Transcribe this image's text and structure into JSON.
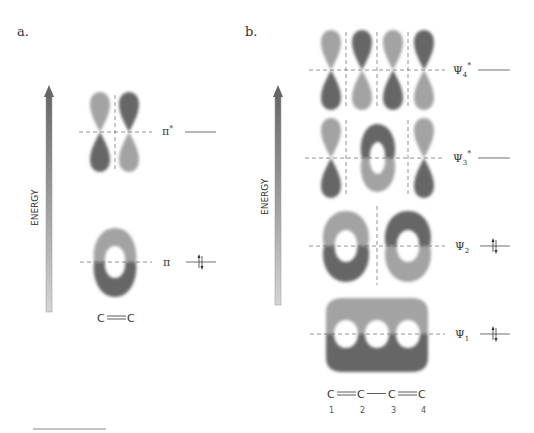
{
  "panels": {
    "a": {
      "label": "a.",
      "axis_label": "ENERGY",
      "molecule": "C═C",
      "molecule_atoms": [
        "C",
        "C"
      ],
      "orbitals": [
        {
          "name": "π*",
          "symbol": "π",
          "superscript": "*",
          "occupancy": 0,
          "type": "antibonding"
        },
        {
          "name": "π",
          "symbol": "π",
          "superscript": "",
          "occupancy": 2,
          "type": "bonding"
        }
      ]
    },
    "b": {
      "label": "b.",
      "axis_label": "ENERGY",
      "molecule": "C═C—C═C",
      "molecule_atoms": [
        "C",
        "C",
        "C",
        "C"
      ],
      "atom_numbers": [
        "1",
        "2",
        "3",
        "4"
      ],
      "orbitals": [
        {
          "name": "Ψ4*",
          "symbol": "Ψ",
          "subscript": "4",
          "superscript": "*",
          "occupancy": 0,
          "nodes": 3
        },
        {
          "name": "Ψ3*",
          "symbol": "Ψ",
          "subscript": "3",
          "superscript": "*",
          "occupancy": 0,
          "nodes": 2
        },
        {
          "name": "Ψ2",
          "symbol": "Ψ",
          "subscript": "2",
          "superscript": "",
          "occupancy": 2,
          "nodes": 1
        },
        {
          "name": "Ψ1",
          "symbol": "Ψ",
          "subscript": "1",
          "superscript": "",
          "occupancy": 2,
          "nodes": 0
        }
      ]
    }
  },
  "colors": {
    "lobe_light": "#a3a3a3",
    "lobe_dark": "#666666",
    "dashed_line": "#777777",
    "level_line": "#888888",
    "arrow_top": "#6a6a6a",
    "arrow_bottom": "#d0d0d0",
    "text": "#333333"
  }
}
